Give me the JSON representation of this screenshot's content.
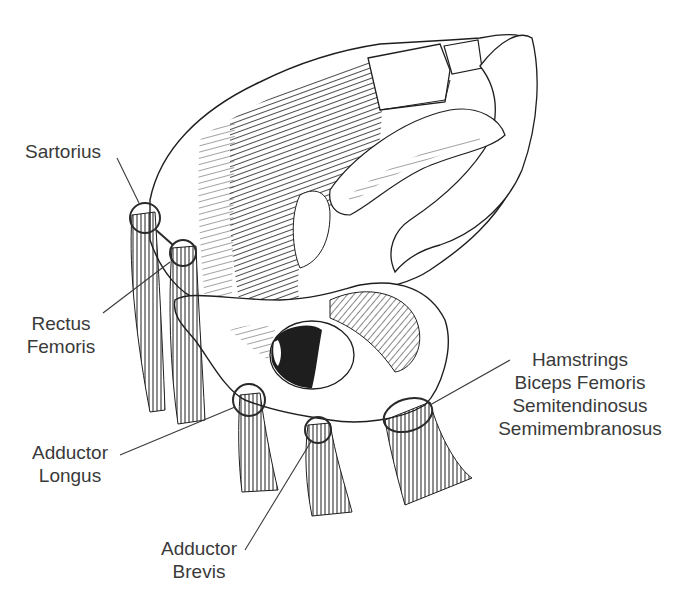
{
  "figure": {
    "colors": {
      "ink": "#1e1e1e",
      "label_text": "#3a3a3a",
      "background": "#ffffff"
    }
  },
  "labels": {
    "sartorius": {
      "lines": [
        "Sartorius"
      ]
    },
    "rectus_femoris": {
      "lines": [
        "Rectus",
        "Femoris"
      ]
    },
    "adductor_longus": {
      "lines": [
        "Adductor",
        "Longus"
      ]
    },
    "adductor_brevis": {
      "lines": [
        "Adductor",
        "Brevis"
      ]
    },
    "hamstrings": {
      "lines": [
        "Hamstrings",
        "Biceps Femoris",
        "Semitendinosus",
        "Semimembranosus"
      ]
    }
  }
}
